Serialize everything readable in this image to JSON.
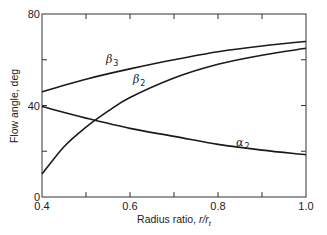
{
  "chart_data": {
    "type": "line",
    "title": "",
    "xlabel": "Radius ratio, r/r_t",
    "xlabel_main": "Radius ratio, ",
    "xlabel_var": "r/r",
    "xlabel_sub": "t",
    "ylabel": "Flow angle, deg",
    "xlim": [
      0.4,
      1.0
    ],
    "ylim": [
      0,
      80
    ],
    "xticks": [
      0.4,
      0.5,
      0.6,
      0.7,
      0.8,
      0.9,
      1.0
    ],
    "xtick_labels": [
      "0.4",
      "",
      "0.6",
      "",
      "0.8",
      "",
      "1.0"
    ],
    "yticks": [
      0,
      20,
      40,
      60,
      80
    ],
    "ytick_labels": [
      "0",
      "",
      "40",
      "",
      "80"
    ],
    "grid": false,
    "legend": "inline labels on curves",
    "series": [
      {
        "name": "β3",
        "label_main": "β",
        "label_sub": "3",
        "x": [
          0.4,
          0.5,
          0.6,
          0.7,
          0.8,
          0.9,
          1.0
        ],
        "values": [
          46,
          51.5,
          56,
          60,
          63.5,
          66,
          68
        ]
      },
      {
        "name": "β2",
        "label_main": "β",
        "label_sub": "2",
        "x": [
          0.4,
          0.45,
          0.5,
          0.55,
          0.6,
          0.7,
          0.8,
          0.9,
          1.0
        ],
        "values": [
          10,
          22,
          30.5,
          37.5,
          43.5,
          52,
          58,
          62,
          65
        ]
      },
      {
        "name": "α2",
        "label_main": "α",
        "label_sub": "2",
        "x": [
          0.4,
          0.5,
          0.6,
          0.7,
          0.8,
          0.9,
          1.0
        ],
        "values": [
          39.5,
          34.5,
          30,
          26.5,
          23,
          20.5,
          18.5
        ]
      }
    ]
  }
}
